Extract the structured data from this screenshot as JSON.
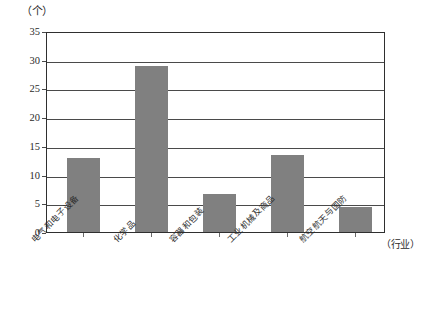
{
  "chart_data": {
    "type": "bar",
    "title": "",
    "subtitle": "",
    "xlabel": "（行业）",
    "ylabel": "（个）",
    "categories": [
      "电气和电子设备",
      "化学品",
      "容器和包装",
      "工业机械及商品",
      "航空航天与国防"
    ],
    "values": [
      12.9,
      29.0,
      6.7,
      13.5,
      4.4
    ],
    "ylim": [
      0,
      35
    ],
    "yticks": [
      0,
      5,
      10,
      15,
      20,
      25,
      30,
      35
    ],
    "ytick_labels": [
      "0",
      "5",
      "10",
      "15",
      "20",
      "25",
      "30",
      "35"
    ],
    "grid": true,
    "legend": false,
    "legend_position": "none",
    "bar_color": "#808080",
    "axis_color": "#2f2f2f",
    "grid_color": "#4a4a4a",
    "background_color": "#ffffff"
  }
}
